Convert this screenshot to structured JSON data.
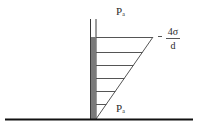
{
  "diagram": {
    "labels": {
      "top_pressure": {
        "symbol": "P",
        "subscript": "a"
      },
      "bottom_pressure": {
        "symbol": "P",
        "subscript": "a"
      },
      "pressure_drop": {
        "numerator": "4σ",
        "denominator": "d",
        "prefix": "-"
      }
    },
    "colors": {
      "line": "#3a3a3a",
      "tube_fill": "#7a7a7a",
      "ground": "#111111",
      "background": "#ffffff"
    },
    "geometry": {
      "tube_left_x": 90,
      "tube_right_x": 96,
      "tube_top_y": 19,
      "liquid_top_y": 37,
      "ground_y": 119,
      "hatch_ys": [
        37,
        52,
        65,
        78,
        91,
        104
      ],
      "diagonal": {
        "x1": 153,
        "y1": 37,
        "x2": 96,
        "y2": 119
      }
    }
  }
}
